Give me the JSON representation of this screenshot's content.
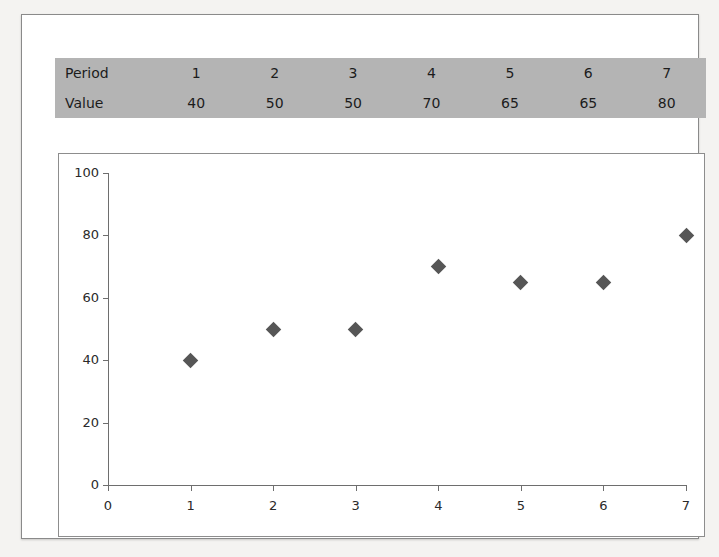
{
  "figure": {
    "table": {
      "rows": [
        {
          "label": "Period",
          "cells": [
            "1",
            "2",
            "3",
            "4",
            "5",
            "6",
            "7"
          ]
        },
        {
          "label": "Value",
          "cells": [
            "40",
            "50",
            "50",
            "70",
            "65",
            "65",
            "80"
          ]
        }
      ],
      "background_color": "#b4b4b4"
    }
  },
  "chart_data": {
    "type": "scatter",
    "title": "",
    "xlabel": "",
    "ylabel": "",
    "categories": [
      1,
      2,
      3,
      4,
      5,
      6,
      7
    ],
    "x": [
      1,
      2,
      3,
      4,
      5,
      6,
      7
    ],
    "values": [
      40,
      50,
      50,
      70,
      65,
      65,
      80
    ],
    "series": [
      {
        "name": "Value",
        "values": [
          40,
          50,
          50,
          70,
          65,
          65,
          80
        ]
      }
    ],
    "xlim": [
      0,
      7
    ],
    "ylim": [
      0,
      100
    ],
    "xticks": [
      "0",
      "1",
      "2",
      "3",
      "4",
      "5",
      "6",
      "7"
    ],
    "yticks": [
      "0",
      "20",
      "40",
      "60",
      "80",
      "100"
    ],
    "grid": false,
    "legend": "none",
    "marker_shape": "diamond",
    "marker_color": "#565656",
    "axis_color": "#6e6e6e",
    "plot_background": "#ffffff"
  }
}
